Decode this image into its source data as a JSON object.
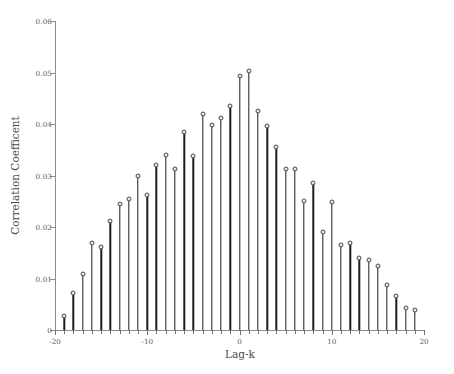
{
  "chart_data": {
    "type": "scatter",
    "plot_style": "stem",
    "title": "",
    "subtitle": "",
    "xlabel": "Lag-k",
    "ylabel": "Correlation Coefficent",
    "xlim": [
      -20,
      20
    ],
    "ylim": [
      0,
      0.06
    ],
    "grid": false,
    "legend": null,
    "legend_position": "none",
    "xticks": [
      -20,
      -10,
      0,
      10,
      20
    ],
    "xtick_labels": [
      "-20",
      "-10",
      "0",
      "10",
      "20"
    ],
    "xminor_tick_step": 1,
    "yticks": [
      0,
      0.01,
      0.02,
      0.03,
      0.04,
      0.05,
      0.06
    ],
    "ytick_labels": [
      "0",
      "0.01",
      "0.02",
      "0.03",
      "0.04",
      "0.05",
      "0.06"
    ],
    "series": [
      {
        "name": "Correlation Coefficent",
        "marker": "circle-open",
        "stem_color": "#1c1c1c",
        "marker_face_color": "#e8e8e8",
        "marker_edge_color": "#4a4a4a",
        "x": [
          -19,
          -18,
          -17,
          -16,
          -15,
          -14,
          -13,
          -12,
          -11,
          -10,
          -9,
          -8,
          -7,
          -6,
          -5,
          -4,
          -3,
          -2,
          -1,
          0,
          1,
          2,
          3,
          4,
          5,
          6,
          7,
          8,
          9,
          10,
          11,
          12,
          13,
          14,
          15,
          16,
          17,
          18,
          19
        ],
        "values": [
          0.0028,
          0.0072,
          0.0108,
          0.0168,
          0.0161,
          0.0211,
          0.0245,
          0.0254,
          0.0299,
          0.0262,
          0.032,
          0.0339,
          0.0313,
          0.0385,
          0.0337,
          0.0419,
          0.0399,
          0.0412,
          0.0434,
          0.0494,
          0.0503,
          0.0426,
          0.0397,
          0.0356,
          0.0313,
          0.0313,
          0.025,
          0.0285,
          0.019,
          0.0248,
          0.0166,
          0.0168,
          0.014,
          0.0135,
          0.0124,
          0.0088,
          0.0066,
          0.0042,
          0.0038
        ]
      }
    ]
  },
  "axis_colors": {
    "axis_line": "#8c8c8c",
    "tick": "#6f6f6f",
    "label_text": "#5a5a5a",
    "title_text": "#4a4a4a",
    "background": "#ffffff"
  }
}
